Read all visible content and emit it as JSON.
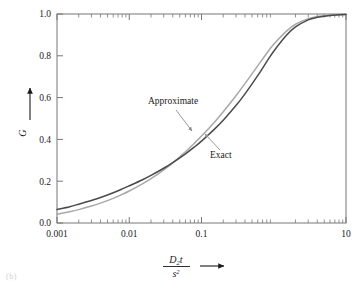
{
  "figure": {
    "background_color": "#ffffff",
    "caption_fragment": "(b)"
  },
  "chart_data": {
    "type": "line",
    "title": "",
    "xlabel": "D2t / s^2",
    "xlabel_parts": {
      "numerator_var": "D",
      "numerator_sub": "2",
      "numerator_var2": "t",
      "denominator_var": "s",
      "denominator_sup": "2",
      "arrow": "→"
    },
    "ylabel": "G",
    "ylabel_arrow": "↑",
    "xscale": "log",
    "yscale": "linear",
    "xlim": [
      0.001,
      10
    ],
    "ylim": [
      0.0,
      1.0
    ],
    "grid": false,
    "legend_position": "inline-annotations",
    "xticks": [
      0.001,
      0.01,
      0.1,
      10
    ],
    "xtick_labels": [
      "0.001",
      "0.01",
      "0.1",
      "10"
    ],
    "yticks": [
      0.0,
      0.2,
      0.4,
      0.6,
      0.8,
      1.0
    ],
    "ytick_labels": [
      "0.0",
      "0.2",
      "0.4",
      "0.6",
      "0.8",
      "1.0"
    ],
    "minor_ticks": true,
    "frame": [
      "left",
      "bottom",
      "top",
      "right"
    ],
    "series": [
      {
        "name": "Exact",
        "color": "#4a4a4a",
        "linewidth": 1.5,
        "x": [
          0.001,
          0.0015,
          0.002,
          0.003,
          0.004,
          0.006,
          0.008,
          0.01,
          0.015,
          0.02,
          0.03,
          0.04,
          0.06,
          0.08,
          0.1,
          0.15,
          0.2,
          0.3,
          0.4,
          0.6,
          0.8,
          1.0,
          1.5,
          2.0,
          3.0,
          4.0,
          6.0,
          8.0,
          10.0
        ],
        "y": [
          0.065,
          0.078,
          0.09,
          0.108,
          0.122,
          0.145,
          0.163,
          0.178,
          0.206,
          0.228,
          0.262,
          0.289,
          0.331,
          0.364,
          0.392,
          0.448,
          0.492,
          0.562,
          0.618,
          0.705,
          0.772,
          0.822,
          0.898,
          0.938,
          0.972,
          0.984,
          0.993,
          0.996,
          0.998
        ]
      },
      {
        "name": "Approximate",
        "color": "#a8a8a8",
        "linewidth": 1.5,
        "x": [
          0.001,
          0.0015,
          0.002,
          0.003,
          0.004,
          0.006,
          0.008,
          0.01,
          0.015,
          0.02,
          0.03,
          0.04,
          0.06,
          0.08,
          0.1,
          0.15,
          0.2,
          0.3,
          0.4,
          0.6,
          0.8,
          1.0,
          1.5,
          2.0,
          3.0,
          4.0,
          6.0,
          8.0,
          10.0
        ],
        "y": [
          0.042,
          0.054,
          0.064,
          0.081,
          0.095,
          0.118,
          0.137,
          0.153,
          0.186,
          0.212,
          0.254,
          0.288,
          0.341,
          0.382,
          0.416,
          0.481,
          0.532,
          0.609,
          0.667,
          0.752,
          0.812,
          0.855,
          0.918,
          0.951,
          0.978,
          0.988,
          0.995,
          0.997,
          0.999
        ]
      }
    ],
    "annotations": [
      {
        "text": "Approximate",
        "target_series": "Approximate",
        "arrow": true,
        "text_x_px": 148,
        "text_y_px": 104,
        "arrow_from_px": [
          176,
          110
        ],
        "arrow_to_px": [
          192,
          131
        ]
      },
      {
        "text": "Exact",
        "target_series": "Exact",
        "arrow": true,
        "text_x_px": 210,
        "text_y_px": 158,
        "arrow_from_px": [
          220,
          150
        ],
        "arrow_to_px": [
          205,
          134
        ]
      }
    ]
  }
}
